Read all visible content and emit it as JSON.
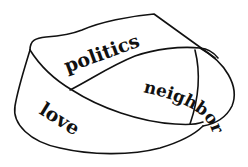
{
  "diagram": {
    "type": "mobius-strip",
    "words": {
      "top": "politics",
      "right": "neighbor",
      "left": "love"
    },
    "colors": {
      "background": "#ffffff",
      "ink": "#111111"
    }
  }
}
